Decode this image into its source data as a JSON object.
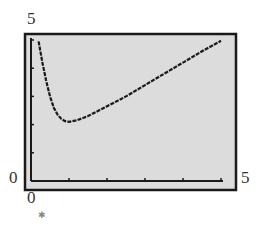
{
  "chart_data": {
    "type": "line",
    "title": "",
    "xlabel": "",
    "ylabel": "",
    "xlim": [
      0,
      5
    ],
    "ylim": [
      0,
      5
    ],
    "grid": false,
    "legend": null,
    "x_tick_labels": {
      "min": "0",
      "max": "5"
    },
    "y_tick_labels": {
      "min": "0",
      "max": "5"
    },
    "x_ticks": [
      0,
      1,
      2,
      3,
      4,
      5
    ],
    "y_ticks": [
      0,
      1,
      2,
      3,
      4,
      5
    ],
    "series": [
      {
        "name": "f(x)",
        "x": [
          0.2,
          0.3,
          0.4,
          0.5,
          0.6,
          0.7,
          0.8,
          0.9,
          1.0,
          1.2,
          1.5,
          2.0,
          2.5,
          3.0,
          3.5,
          4.0,
          4.5,
          5.0
        ],
        "y": [
          4.95,
          4.2,
          3.55,
          3.0,
          2.6,
          2.35,
          2.2,
          2.12,
          2.1,
          2.15,
          2.3,
          2.65,
          3.0,
          3.4,
          3.8,
          4.2,
          4.6,
          4.97
        ]
      }
    ],
    "colors": {
      "background": "#dcdcdc",
      "frame": "#1a1a1a",
      "curve": "#1a1a1a"
    }
  },
  "labels": {
    "y_max": "5",
    "y_min": "0",
    "x_min": "0",
    "x_max": "5"
  }
}
